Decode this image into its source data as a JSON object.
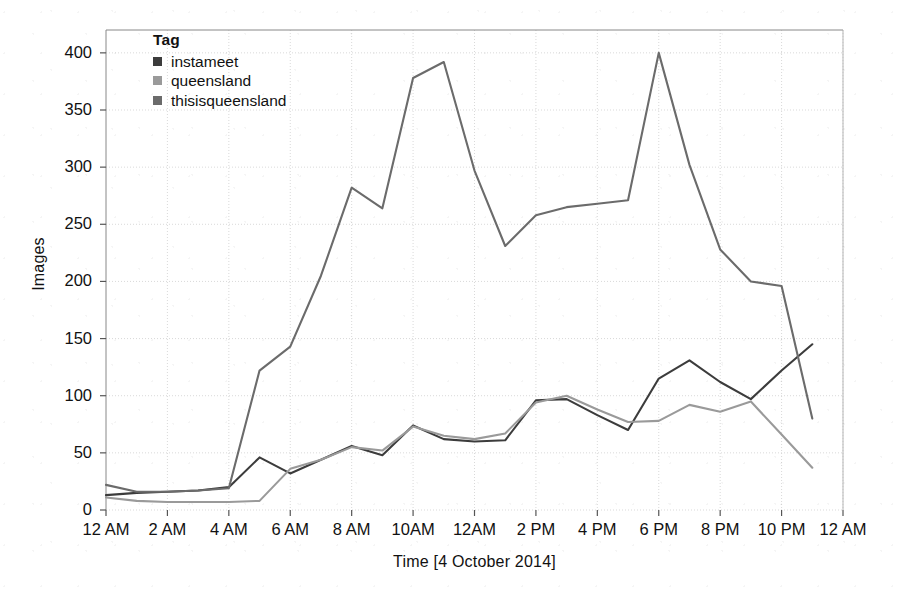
{
  "chart_data": {
    "type": "line",
    "title": "",
    "xlabel": "Time [4 October 2014]",
    "ylabel": "Images",
    "ylim": [
      0,
      420
    ],
    "xlim": [
      0,
      24
    ],
    "grid": true,
    "legend_title": "Tag",
    "legend_position": "top-left-inside",
    "ytick_labels": [
      "0",
      "50",
      "100",
      "150",
      "200",
      "250",
      "300",
      "350",
      "400"
    ],
    "ytick_values": [
      0,
      50,
      100,
      150,
      200,
      250,
      300,
      350,
      400
    ],
    "xtick_labels": [
      "12 AM",
      "2 AM",
      "4 AM",
      "6 AM",
      "8 AM",
      "10AM",
      "12AM",
      "2 PM",
      "4 PM",
      "6 PM",
      "8 PM",
      "10 PM",
      "12 AM"
    ],
    "xtick_values": [
      0,
      2,
      4,
      6,
      8,
      10,
      12,
      14,
      16,
      18,
      20,
      22,
      24
    ],
    "x": [
      0,
      1,
      2,
      3,
      4,
      5,
      6,
      7,
      8,
      9,
      10,
      11,
      12,
      13,
      14,
      15,
      16,
      17,
      18,
      19,
      20,
      21,
      22,
      23
    ],
    "series": [
      {
        "name": "instameet",
        "color": "#3c3c3c",
        "values": [
          13,
          15,
          16,
          17,
          20,
          46,
          32,
          44,
          56,
          48,
          74,
          62,
          60,
          61,
          96,
          97,
          83,
          70,
          115,
          131,
          112,
          97,
          122,
          145
        ]
      },
      {
        "name": "queensland",
        "color": "#9a9a9a",
        "values": [
          11,
          8,
          7,
          7,
          7,
          8,
          36,
          44,
          55,
          52,
          73,
          65,
          62,
          67,
          94,
          100,
          88,
          77,
          78,
          92,
          86,
          95,
          66,
          37
        ]
      },
      {
        "name": "thisisqueensland",
        "color": "#6b6b6b",
        "values": [
          22,
          16,
          16,
          17,
          19,
          122,
          143,
          205,
          282,
          264,
          378,
          392,
          297,
          231,
          258,
          265,
          268,
          271,
          400,
          302,
          228,
          200,
          196,
          80
        ]
      }
    ]
  }
}
